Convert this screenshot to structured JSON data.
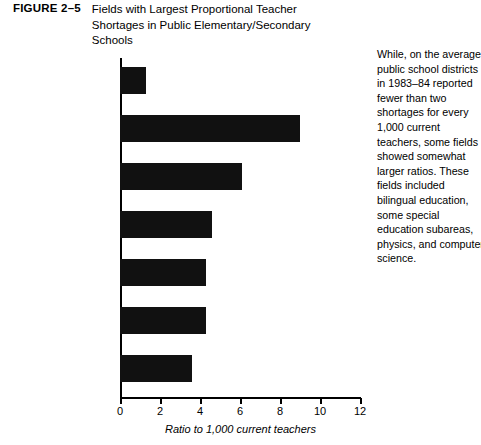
{
  "figure": {
    "number": "FIGURE 2–5",
    "title_lines": [
      "Fields with Largest Proportional Teacher",
      "Shortages in Public Elementary/Secondary",
      "Schools"
    ]
  },
  "caption_lines": [
    "While, on the average,",
    "public school districts",
    "in 1983–84 reported",
    "fewer than two",
    "shortages for every",
    "1,000 current",
    "teachers, some fields",
    "showed somewhat",
    "larger ratios. These",
    "fields included",
    "bilingual education,",
    "some special",
    "education subareas,",
    "physics, and computer",
    "science."
  ],
  "chart_data": {
    "type": "bar",
    "orientation": "horizontal",
    "title": "Fields with Largest Proportional Teacher Shortages in Public Elementary/Secondary Schools",
    "xlabel": "Ratio to 1,000 current teachers",
    "ylabel": "",
    "xlim": [
      0,
      12
    ],
    "xticks": [
      0,
      2,
      4,
      6,
      8,
      10,
      12
    ],
    "grid": false,
    "legend": false,
    "bar_color": "#111111",
    "categories": [
      "All fields",
      "Bilingual education",
      "Special education\nSpeech impaired",
      "Special education –\nUnspecified",
      "Special education –\nSeriously emotionally\ndisturbed",
      "Physics",
      "Computer science"
    ],
    "category_label_lines": [
      [
        "All fields"
      ],
      [
        "Bilingual education"
      ],
      [
        "Special education",
        "Speech impaired"
      ],
      [
        "Special education –",
        "Unspecified"
      ],
      [
        "Special education –",
        "Seriously emotionally",
        "disturbed"
      ],
      [
        "Physics"
      ],
      [
        "Computer science"
      ]
    ],
    "values": [
      1.3,
      9.0,
      6.1,
      4.6,
      4.3,
      4.3,
      3.6
    ]
  }
}
